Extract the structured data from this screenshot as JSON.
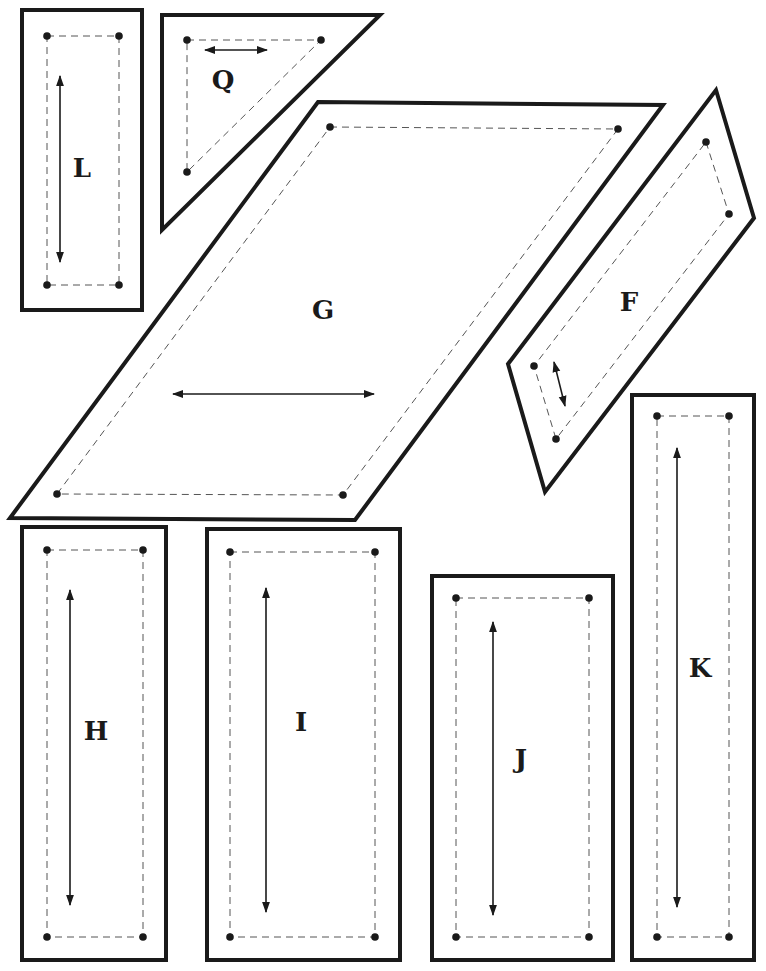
{
  "colors": {
    "outline": "#1a1a1a",
    "seam": "#555555",
    "background": "#ffffff"
  },
  "pieces": [
    {
      "id": "L",
      "label": "L",
      "shape": "rectangle",
      "cut": [
        [
          22,
          10
        ],
        [
          142,
          10
        ],
        [
          142,
          310
        ],
        [
          22,
          310
        ]
      ],
      "seam": [
        [
          47,
          36
        ],
        [
          119,
          36
        ],
        [
          119,
          285
        ],
        [
          47,
          285
        ]
      ],
      "grain": [
        [
          60,
          76
        ],
        [
          60,
          262
        ]
      ],
      "label_pos": [
        82,
        168
      ]
    },
    {
      "id": "Q",
      "label": "Q",
      "shape": "triangle",
      "cut": [
        [
          162,
          15
        ],
        [
          380,
          15
        ],
        [
          162,
          230
        ]
      ],
      "seam": [
        [
          187,
          40
        ],
        [
          321,
          40
        ],
        [
          187,
          172
        ]
      ],
      "grain": [
        [
          205,
          50
        ],
        [
          267,
          50
        ]
      ],
      "label_pos": [
        223,
        80
      ]
    },
    {
      "id": "G",
      "label": "G",
      "shape": "parallelogram",
      "cut": [
        [
          318,
          102
        ],
        [
          663,
          105
        ],
        [
          355,
          520
        ],
        [
          10,
          518
        ]
      ],
      "seam": [
        [
          330,
          127
        ],
        [
          618,
          129
        ],
        [
          343,
          495
        ],
        [
          57,
          494
        ]
      ],
      "grain": [
        [
          173,
          394
        ],
        [
          374,
          394
        ]
      ],
      "label_pos": [
        323,
        310
      ]
    },
    {
      "id": "F",
      "label": "F",
      "shape": "parallelogram",
      "cut": [
        [
          716,
          90
        ],
        [
          754,
          218
        ],
        [
          545,
          492
        ],
        [
          508,
          364
        ]
      ],
      "seam": [
        [
          706,
          142
        ],
        [
          729,
          214
        ],
        [
          556,
          439
        ],
        [
          534,
          366
        ]
      ],
      "grain": [
        [
          554,
          362
        ],
        [
          565,
          406
        ]
      ],
      "label_pos": [
        629,
        302
      ]
    },
    {
      "id": "H",
      "label": "H",
      "shape": "rectangle",
      "cut": [
        [
          22,
          527
        ],
        [
          166,
          527
        ],
        [
          166,
          960
        ],
        [
          22,
          960
        ]
      ],
      "seam": [
        [
          47,
          550
        ],
        [
          143,
          550
        ],
        [
          143,
          937
        ],
        [
          47,
          937
        ]
      ],
      "grain": [
        [
          70,
          590
        ],
        [
          70,
          905
        ]
      ],
      "label_pos": [
        96,
        731
      ]
    },
    {
      "id": "I",
      "label": "I",
      "shape": "rectangle",
      "cut": [
        [
          207,
          529
        ],
        [
          400,
          529
        ],
        [
          400,
          960
        ],
        [
          207,
          960
        ]
      ],
      "seam": [
        [
          230,
          552
        ],
        [
          375,
          552
        ],
        [
          375,
          937
        ],
        [
          230,
          937
        ]
      ],
      "grain": [
        [
          266,
          588
        ],
        [
          266,
          912
        ]
      ],
      "label_pos": [
        301,
        722
      ]
    },
    {
      "id": "J",
      "label": "J",
      "shape": "rectangle",
      "cut": [
        [
          432,
          576
        ],
        [
          613,
          576
        ],
        [
          613,
          960
        ],
        [
          432,
          960
        ]
      ],
      "seam": [
        [
          456,
          598
        ],
        [
          589,
          598
        ],
        [
          589,
          937
        ],
        [
          456,
          937
        ]
      ],
      "grain": [
        [
          493,
          622
        ],
        [
          493,
          915
        ]
      ],
      "label_pos": [
        521,
        759
      ]
    },
    {
      "id": "K",
      "label": "K",
      "shape": "rectangle",
      "cut": [
        [
          632,
          395
        ],
        [
          754,
          395
        ],
        [
          754,
          960
        ],
        [
          632,
          960
        ]
      ],
      "seam": [
        [
          657,
          416
        ],
        [
          729,
          416
        ],
        [
          729,
          937
        ],
        [
          657,
          937
        ]
      ],
      "grain": [
        [
          677,
          448
        ],
        [
          677,
          907
        ]
      ],
      "label_pos": [
        700,
        668
      ]
    }
  ]
}
